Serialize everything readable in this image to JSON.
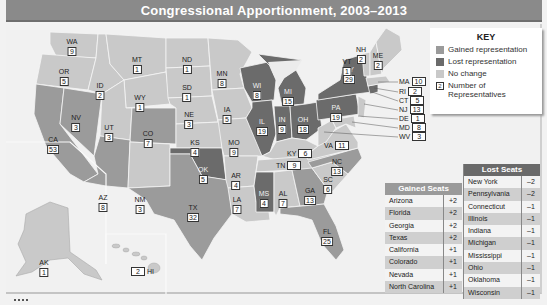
{
  "title": "Congressional Apportionment, 2003–2013",
  "colors": {
    "gained": "#9b9b9b",
    "lost": "#6b6b6b",
    "no_change": "#c9c9c9",
    "water": "#f1f1f1",
    "title_bar": "#8a8a8a"
  },
  "key": {
    "title": "KEY",
    "items": [
      {
        "label": "Gained representation",
        "swatch": "gained"
      },
      {
        "label": "Lost representation",
        "swatch": "lost"
      },
      {
        "label": "No change",
        "swatch": "no_change"
      },
      {
        "label": "Number of Representatives",
        "swatch": "number",
        "sample": "2"
      }
    ]
  },
  "states": [
    {
      "abbr": "WA",
      "reps": "9",
      "status": "no_change"
    },
    {
      "abbr": "OR",
      "reps": "5",
      "status": "no_change"
    },
    {
      "abbr": "CA",
      "reps": "53",
      "status": "gained"
    },
    {
      "abbr": "ID",
      "reps": "2",
      "status": "no_change"
    },
    {
      "abbr": "NV",
      "reps": "3",
      "status": "gained"
    },
    {
      "abbr": "MT",
      "reps": "1",
      "status": "no_change"
    },
    {
      "abbr": "WY",
      "reps": "1",
      "status": "no_change"
    },
    {
      "abbr": "UT",
      "reps": "3",
      "status": "no_change"
    },
    {
      "abbr": "AZ",
      "reps": "8",
      "status": "gained"
    },
    {
      "abbr": "CO",
      "reps": "7",
      "status": "gained"
    },
    {
      "abbr": "NM",
      "reps": "3",
      "status": "no_change"
    },
    {
      "abbr": "ND",
      "reps": "1",
      "status": "no_change"
    },
    {
      "abbr": "SD",
      "reps": "1",
      "status": "no_change"
    },
    {
      "abbr": "NE",
      "reps": "3",
      "status": "no_change"
    },
    {
      "abbr": "KS",
      "reps": "4",
      "status": "no_change"
    },
    {
      "abbr": "OK",
      "reps": "5",
      "status": "lost"
    },
    {
      "abbr": "TX",
      "reps": "32",
      "status": "gained"
    },
    {
      "abbr": "MN",
      "reps": "8",
      "status": "no_change"
    },
    {
      "abbr": "IA",
      "reps": "5",
      "status": "no_change"
    },
    {
      "abbr": "MO",
      "reps": "9",
      "status": "no_change"
    },
    {
      "abbr": "AR",
      "reps": "4",
      "status": "no_change"
    },
    {
      "abbr": "LA",
      "reps": "7",
      "status": "no_change"
    },
    {
      "abbr": "WI",
      "reps": "8",
      "status": "lost"
    },
    {
      "abbr": "IL",
      "reps": "19",
      "status": "lost"
    },
    {
      "abbr": "MI",
      "reps": "15",
      "status": "lost"
    },
    {
      "abbr": "IN",
      "reps": "9",
      "status": "lost"
    },
    {
      "abbr": "OH",
      "reps": "18",
      "status": "lost"
    },
    {
      "abbr": "KY",
      "reps": "6",
      "status": "no_change"
    },
    {
      "abbr": "TN",
      "reps": "9",
      "status": "no_change"
    },
    {
      "abbr": "MS",
      "reps": "4",
      "status": "lost"
    },
    {
      "abbr": "AL",
      "reps": "7",
      "status": "no_change"
    },
    {
      "abbr": "GA",
      "reps": "13",
      "status": "gained"
    },
    {
      "abbr": "FL",
      "reps": "25",
      "status": "gained"
    },
    {
      "abbr": "SC",
      "reps": "6",
      "status": "no_change"
    },
    {
      "abbr": "NC",
      "reps": "13",
      "status": "gained"
    },
    {
      "abbr": "VA",
      "reps": "11",
      "status": "no_change"
    },
    {
      "abbr": "WV",
      "reps": "3",
      "status": "no_change"
    },
    {
      "abbr": "PA",
      "reps": "19",
      "status": "lost"
    },
    {
      "abbr": "NY",
      "reps": "29",
      "status": "lost"
    },
    {
      "abbr": "VT",
      "reps": "1",
      "status": "no_change"
    },
    {
      "abbr": "NH",
      "reps": "2",
      "status": "no_change"
    },
    {
      "abbr": "ME",
      "reps": "2",
      "status": "no_change"
    },
    {
      "abbr": "MA",
      "reps": "10",
      "status": "no_change"
    },
    {
      "abbr": "RI",
      "reps": "2",
      "status": "no_change"
    },
    {
      "abbr": "CT",
      "reps": "5",
      "status": "lost"
    },
    {
      "abbr": "NJ",
      "reps": "13",
      "status": "no_change"
    },
    {
      "abbr": "DE",
      "reps": "1",
      "status": "no_change"
    },
    {
      "abbr": "MD",
      "reps": "8",
      "status": "no_change"
    },
    {
      "abbr": "AK",
      "reps": "1",
      "status": "no_change"
    },
    {
      "abbr": "HI",
      "reps": "2",
      "status": "no_change"
    }
  ],
  "gained_seats": {
    "header": "Gained Seats",
    "rows": [
      {
        "state": "Arizona",
        "change": "+2"
      },
      {
        "state": "Florida",
        "change": "+2"
      },
      {
        "state": "Georgia",
        "change": "+2"
      },
      {
        "state": "Texas",
        "change": "+2"
      },
      {
        "state": "California",
        "change": "+1"
      },
      {
        "state": "Colorado",
        "change": "+1"
      },
      {
        "state": "Nevada",
        "change": "+1"
      },
      {
        "state": "North Carolina",
        "change": "+1"
      }
    ]
  },
  "lost_seats": {
    "header": "Lost Seats",
    "rows": [
      {
        "state": "New York",
        "change": "–2"
      },
      {
        "state": "Pennsylvania",
        "change": "–2"
      },
      {
        "state": "Connecticut",
        "change": "–1"
      },
      {
        "state": "Illinois",
        "change": "–1"
      },
      {
        "state": "Indiana",
        "change": "–1"
      },
      {
        "state": "Michigan",
        "change": "–1"
      },
      {
        "state": "Mississippi",
        "change": "–1"
      },
      {
        "state": "Ohio",
        "change": "–1"
      },
      {
        "state": "Oklahoma",
        "change": "–1"
      },
      {
        "state": "Wisconsin",
        "change": "–1"
      }
    ]
  },
  "source": "SOURCE: Census 2000"
}
